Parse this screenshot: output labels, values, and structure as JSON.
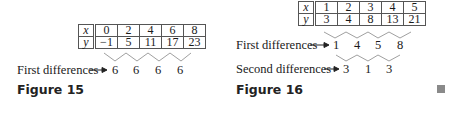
{
  "figure15": {
    "caption": "Figure 15",
    "table": {
      "row_x": {
        "label": "x",
        "values": [
          "0",
          "2",
          "4",
          "6",
          "8"
        ]
      },
      "row_y": {
        "label": "y",
        "values": [
          "−1",
          "5",
          "11",
          "17",
          "23"
        ]
      }
    },
    "first_differences_label": "First differences",
    "first_differences": [
      "6",
      "6",
      "6",
      "6"
    ]
  },
  "figure16": {
    "caption": "Figure 16",
    "table": {
      "row_x": {
        "label": "x",
        "values": [
          "1",
          "2",
          "3",
          "4",
          "5"
        ]
      },
      "row_y": {
        "label": "y",
        "values": [
          "3",
          "4",
          "8",
          "13",
          "21"
        ]
      }
    },
    "first_differences_label": "First differences",
    "first_differences": [
      "1",
      "4",
      "5",
      "8"
    ],
    "second_differences_label": "Second differences",
    "second_differences": [
      "3",
      "1",
      "3"
    ]
  },
  "end_marker": "end-of-proof-square",
  "colors": {
    "text": "#1a1a1a",
    "border": "#555555",
    "connector": "#a0a0a0",
    "qed": "#8a8a8a"
  }
}
